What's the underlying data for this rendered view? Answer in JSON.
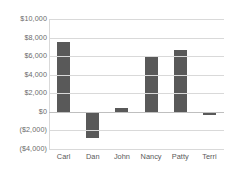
{
  "chart_data": {
    "type": "bar",
    "title": "",
    "xlabel": "",
    "ylabel": "",
    "categories": [
      "Carl",
      "Dan",
      "John",
      "Nancy",
      "Patty",
      "Terri"
    ],
    "values": [
      7500,
      -2800,
      400,
      5900,
      6700,
      -300
    ],
    "ylim": [
      -4000,
      10000
    ],
    "ytick_values": [
      10000,
      8000,
      6000,
      4000,
      2000,
      0,
      -2000,
      -4000
    ],
    "ytick_labels": [
      "$10,000",
      "$8,000",
      "$6,000",
      "$4,000",
      "$2,000",
      "$0",
      "($2,000)",
      "($4,000)"
    ],
    "grid": true,
    "legend": false,
    "legend_position": "none",
    "bar_color": "#595959",
    "gridline_color": "#d9d9d9",
    "axis_color": "#bfbfbf",
    "label_color": "#6b6b6b",
    "background": "#ffffff"
  }
}
